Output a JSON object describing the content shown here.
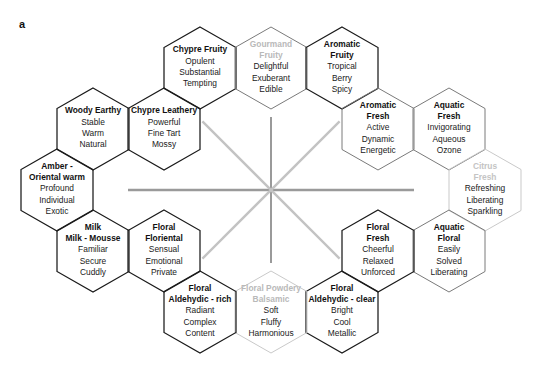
{
  "figure": {
    "panel_label": "a",
    "background_color": "#ffffff",
    "hex_stroke_dark": "#1a1a1a",
    "hex_stroke_mid": "#7a7a7a",
    "hex_stroke_light": "#c9c9c9",
    "faded_title_color": "#b9b9b9",
    "star_color": "#c3c3c3",
    "star_color_strong": "#9a9a9a"
  },
  "star": {
    "name": "center-star",
    "center_x": 271,
    "center_y": 190,
    "horizontal_half_len": 143,
    "vertical_half_len": 73,
    "diagonal_half_len": 97
  },
  "hexes": [
    {
      "id": "chypre-fruity",
      "title": "Chypre Fruity",
      "descriptors": [
        "Opulent",
        "Substantial",
        "Tempting"
      ],
      "cx": 200,
      "cy": 68,
      "stroke": "dark",
      "title_style": "normal"
    },
    {
      "id": "gourmand-fruity",
      "title": "Gourmand\nFruity",
      "title_lines": [
        "Gourmand",
        "Fruity"
      ],
      "descriptors": [
        "Delightful",
        "Exuberant",
        "Edible"
      ],
      "cx": 271,
      "cy": 68,
      "stroke": "mid",
      "title_style": "faded"
    },
    {
      "id": "aromatic-fruity",
      "title_lines": [
        "Aromatic",
        "Fruity"
      ],
      "descriptors": [
        "Tropical",
        "Berry",
        "Spicy"
      ],
      "cx": 342,
      "cy": 68,
      "stroke": "dark",
      "title_style": "normal"
    },
    {
      "id": "aromatic-fresh",
      "title_lines": [
        "Aromatic",
        "Fresh"
      ],
      "descriptors": [
        "Active",
        "Dynamic",
        "Energetic"
      ],
      "cx": 378,
      "cy": 129,
      "stroke": "mid",
      "title_style": "normal"
    },
    {
      "id": "aquatic-fresh",
      "title_lines": [
        "Aquatic",
        "Fresh"
      ],
      "descriptors": [
        "Invigorating",
        "Aqueous",
        "Ozone"
      ],
      "cx": 449,
      "cy": 129,
      "stroke": "mid",
      "title_style": "normal"
    },
    {
      "id": "citrus-fresh",
      "title_lines": [
        "Citrus",
        "Fresh"
      ],
      "descriptors": [
        "Refreshing",
        "Liberating",
        "Sparkling"
      ],
      "cx": 485,
      "cy": 190,
      "stroke": "light",
      "title_style": "faded2"
    },
    {
      "id": "aquatic-floral",
      "title_lines": [
        "Aquatic",
        "Floral"
      ],
      "descriptors": [
        "Easily",
        "Solved",
        "Liberating"
      ],
      "cx": 449,
      "cy": 251,
      "stroke": "mid",
      "title_style": "normal"
    },
    {
      "id": "floral-fresh",
      "title_lines": [
        "Floral",
        "Fresh"
      ],
      "descriptors": [
        "Cheerful",
        "Relaxed",
        "Unforced"
      ],
      "cx": 378,
      "cy": 251,
      "stroke": "dark",
      "title_style": "normal"
    },
    {
      "id": "floral-aldehydic-clear",
      "title_lines": [
        "Floral",
        "Aldehydic - clear"
      ],
      "descriptors": [
        "Bright",
        "Cool",
        "Metallic"
      ],
      "cx": 342,
      "cy": 312,
      "stroke": "dark",
      "title_style": "normal"
    },
    {
      "id": "floral-powdery",
      "title_lines": [
        "Floral Powdery",
        "Balsamic"
      ],
      "descriptors": [
        "Soft",
        "Fluffy",
        "Harmonious"
      ],
      "cx": 271,
      "cy": 312,
      "stroke": "light",
      "title_style": "faded"
    },
    {
      "id": "floral-aldehydic-rich",
      "title_lines": [
        "Floral",
        "Aldehydic - rich"
      ],
      "descriptors": [
        "Radiant",
        "Complex",
        "Content"
      ],
      "cx": 200,
      "cy": 312,
      "stroke": "dark",
      "title_style": "normal"
    },
    {
      "id": "floral-floriental",
      "title_lines": [
        "Floral",
        "Floriental"
      ],
      "descriptors": [
        "Sensual",
        "Emotional",
        "Private"
      ],
      "cx": 164,
      "cy": 251,
      "stroke": "dark",
      "title_style": "normal"
    },
    {
      "id": "milk-mousse",
      "title_lines": [
        "Milk",
        "Milk - Mousse"
      ],
      "descriptors": [
        "Familiar",
        "Secure",
        "Cuddly"
      ],
      "cx": 93,
      "cy": 251,
      "stroke": "dark",
      "title_style": "normal"
    },
    {
      "id": "amber-oriental-warm",
      "title_lines": [
        "Amber -",
        "Oriental warm"
      ],
      "descriptors": [
        "Profound",
        "Individual",
        "Exotic"
      ],
      "cx": 57,
      "cy": 190,
      "stroke": "dark",
      "title_style": "normal"
    },
    {
      "id": "woody-earthy",
      "title_lines": [
        "Woody Earthy"
      ],
      "descriptors": [
        "Stable",
        "Warm",
        "Natural"
      ],
      "cx": 93,
      "cy": 129,
      "stroke": "dark",
      "title_style": "normal"
    },
    {
      "id": "chypre-leathery",
      "title_lines": [
        "Chypre Leathery"
      ],
      "descriptors": [
        "Powerful",
        "Fine Tart",
        "Mossy"
      ],
      "cx": 164,
      "cy": 129,
      "stroke": "dark",
      "title_style": "normal"
    }
  ]
}
